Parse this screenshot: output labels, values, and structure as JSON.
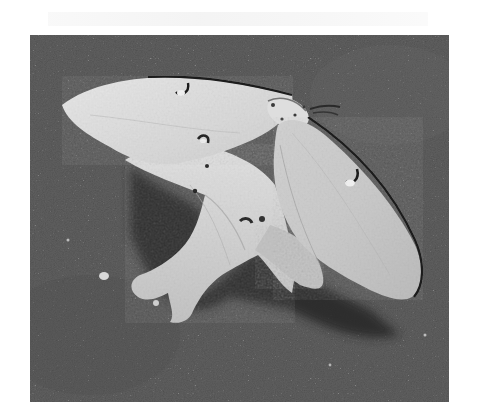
{
  "image": {
    "subject": "Luna moth resting on gravel asphalt",
    "style": "grayscale photograph",
    "alt": "A pale moth with long swallow-tail hindwings and small eyespots resting on dark textured ground, casting a shadow"
  },
  "colors": {
    "ground": "#5e5e5e",
    "ground_dark": "#3a3a3a",
    "wing_light": "#e4e4e4",
    "wing_mid": "#c9c9c9",
    "wing_edge": "#1e1e1e",
    "shadow": "#2c2c2c",
    "page_background": "#ffffff"
  }
}
